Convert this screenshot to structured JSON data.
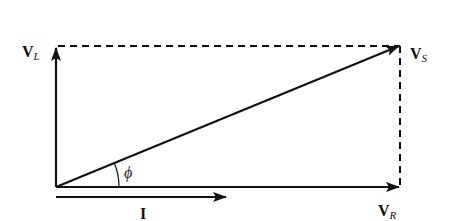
{
  "diagram": {
    "labels": {
      "vl": {
        "main": "V",
        "sub": "L"
      },
      "vs": {
        "main": "V",
        "sub": "S"
      },
      "vr": {
        "main": "V",
        "sub": "R"
      },
      "current": "I",
      "angle": "ϕ"
    },
    "colors": {
      "stroke": "#111111",
      "background": "#ffffff"
    }
  }
}
